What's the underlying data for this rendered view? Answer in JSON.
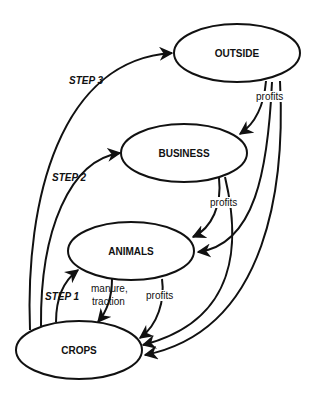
{
  "diagram": {
    "nodes": {
      "outside": {
        "label": "OUTSIDE"
      },
      "business": {
        "label": "BUSINESS"
      },
      "animals": {
        "label": "ANIMALS"
      },
      "crops": {
        "label": "CROPS"
      }
    },
    "edges": {
      "step1": {
        "label": "STEP 1",
        "from": "CROPS",
        "to": "ANIMALS"
      },
      "step2": {
        "label": "STEP 2",
        "from": "CROPS",
        "to": "BUSINESS"
      },
      "step3": {
        "label": "STEP 3",
        "from": "CROPS",
        "to": "OUTSIDE"
      },
      "manure": {
        "label_line1": "manure,",
        "label_line2": "traction",
        "from": "ANIMALS",
        "to": "CROPS"
      },
      "animals_profits": {
        "label": "profits",
        "from": "ANIMALS",
        "to": "CROPS"
      },
      "business_profits": {
        "label": "profits",
        "from": "BUSINESS",
        "to": "ANIMALS / CROPS"
      },
      "outside_profits": {
        "label": "profits",
        "from": "OUTSIDE",
        "to": "BUSINESS / ANIMALS / CROPS"
      }
    },
    "colors": {
      "stroke": "#111111",
      "background": "#ffffff"
    }
  }
}
